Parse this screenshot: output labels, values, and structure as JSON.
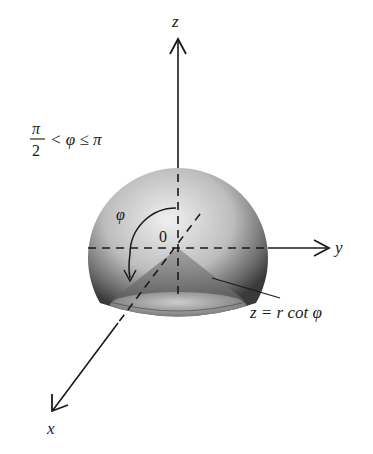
{
  "figure": {
    "type": "3d-spherical-coordinates-diagram",
    "axes": {
      "z": {
        "label": "z"
      },
      "y": {
        "label": "y"
      },
      "x": {
        "label": "x"
      }
    },
    "origin_label": "0",
    "angle_label": "φ",
    "condition": {
      "numerator": "π",
      "denominator": "2",
      "rest": "< φ ≤ π"
    },
    "surface_label": "z = r cot φ",
    "colors": {
      "axis": "#1a1a1a",
      "sphere_light": "#e6e6e6",
      "sphere_dark": "#3a3a3a"
    }
  }
}
